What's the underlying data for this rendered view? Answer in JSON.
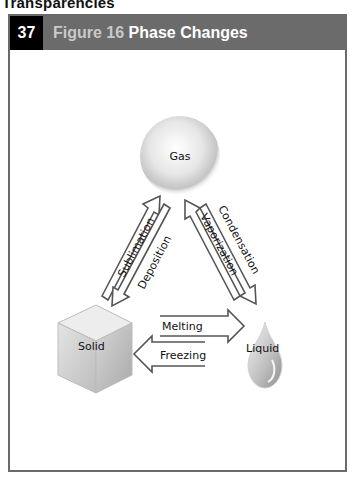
{
  "page": {
    "section_title": "Transparencies"
  },
  "header": {
    "number": "37",
    "figure_label": "Figure 16",
    "title": "Phase Changes",
    "colors": {
      "number_bg": "#000000",
      "bar_bg": "#6b6b6b",
      "figure_text": "#c9c9c9",
      "title_text": "#ffffff"
    }
  },
  "diagram": {
    "states": {
      "gas": "Gas",
      "solid": "Solid",
      "liquid": "Liquid"
    },
    "transitions": {
      "sublimation": "Sublimation",
      "deposition": "Deposition",
      "condensation": "Condensation",
      "vaporization": "Vaporization",
      "melting": "Melting",
      "freezing": "Freezing"
    }
  }
}
